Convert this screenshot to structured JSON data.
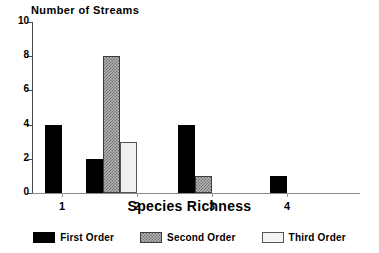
{
  "chart_data": {
    "type": "bar",
    "title": "Number of Streams",
    "xlabel": "Species Richness",
    "ylabel": "",
    "categories": [
      "1",
      "2",
      "3",
      "4"
    ],
    "series": [
      {
        "name": "First Order",
        "values": [
          4,
          2,
          4,
          1
        ],
        "color": "#000000",
        "fill": "solid-black"
      },
      {
        "name": "Second Order",
        "values": [
          0,
          8,
          1,
          0
        ],
        "color": "#808080",
        "fill": "gray-crosshatch"
      },
      {
        "name": "Third Order",
        "values": [
          0,
          3,
          0,
          0
        ],
        "color": "#f0f0f0",
        "fill": "light-gray"
      }
    ],
    "ylim": [
      0,
      10
    ],
    "yticks": [
      0,
      2,
      4,
      6,
      8,
      10
    ],
    "ytick_labels": [
      "0",
      "2",
      "4",
      "6",
      "8",
      "10"
    ],
    "xtick_labels": [
      "1",
      "2",
      "3",
      "4"
    ],
    "grid": false,
    "legend_position": "bottom"
  },
  "legend": {
    "items": [
      {
        "label": "First Order"
      },
      {
        "label": "Second Order"
      },
      {
        "label": "Third Order"
      }
    ]
  }
}
